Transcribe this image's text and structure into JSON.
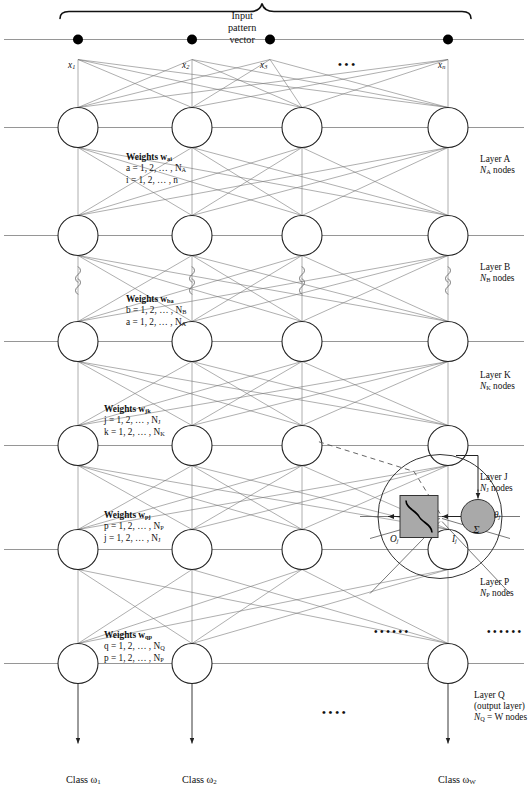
{
  "figure": {
    "type": "neural-network-diagram",
    "orientation": "rotated-90-ccw",
    "background": "#ffffff",
    "line_color": "#4a4a4a",
    "node_stroke": "#222222",
    "inset_fill": "#a9a9a9"
  },
  "outputs": {
    "class_labels": [
      "Class ω",
      "Class ω",
      "Class ω"
    ],
    "class_subs": [
      "1",
      "2",
      "W"
    ],
    "ellipsis": "• • • •"
  },
  "inputs": {
    "labels": [
      "x",
      "x",
      "x",
      "x"
    ],
    "subs": [
      "1",
      "2",
      "3",
      "n"
    ],
    "ellipsis": "• • •",
    "brace_label_lines": [
      "Input",
      "pattern",
      "vector"
    ]
  },
  "layers": [
    {
      "id": "layer-q",
      "lines": [
        "Layer Q",
        "(output layer)",
        "N  = W nodes"
      ],
      "name": "Layer Q",
      "sub": "Q",
      "detail": "(output layer)",
      "nodes_text": "N",
      "nodes_eq": "= W nodes",
      "node_count_visible": 3
    },
    {
      "id": "layer-p",
      "lines": [
        "Layer P",
        "N  nodes"
      ],
      "name": "Layer P",
      "sub": "P",
      "nodes_text": "N",
      "nodes_eq": "nodes",
      "node_count_visible": 4
    },
    {
      "id": "layer-j",
      "lines": [
        "Layer J",
        "N  nodes"
      ],
      "name": "Layer J",
      "sub": "J",
      "nodes_text": "N",
      "nodes_eq": "nodes",
      "node_count_visible": 4
    },
    {
      "id": "layer-k",
      "lines": [
        "Layer K",
        "N  nodes"
      ],
      "name": "Layer K",
      "sub": "K",
      "nodes_text": "N",
      "nodes_eq": "nodes",
      "node_count_visible": 4
    },
    {
      "id": "layer-b",
      "lines": [
        "Layer B",
        "N  nodes"
      ],
      "name": "Layer B",
      "sub": "B",
      "nodes_text": "N",
      "nodes_eq": "nodes",
      "node_count_visible": 4
    },
    {
      "id": "layer-a",
      "lines": [
        "Layer A",
        "N  nodes"
      ],
      "name": "Layer A",
      "sub": "A",
      "nodes_text": "N",
      "nodes_eq": "nodes",
      "node_count_visible": 4
    }
  ],
  "weights": [
    {
      "id": "weights-qp",
      "title": "Weights w",
      "title_sub": "qp",
      "range1": "q = 1, 2, … , N",
      "range1_sub": "Q",
      "range2": "p = 1, 2, … , N",
      "range2_sub": "P"
    },
    {
      "id": "weights-pj",
      "title": "Weights w",
      "title_sub": "pj",
      "range1": "p = 1, 2, … , N",
      "range1_sub": "P",
      "range2": "j = 1, 2, … , N",
      "range2_sub": "J"
    },
    {
      "id": "weights-jk",
      "title": "Weights w",
      "title_sub": "jk",
      "range1": "j = 1, 2, … , N",
      "range1_sub": "J",
      "range2": "k = 1, 2, … , N",
      "range2_sub": "K"
    },
    {
      "id": "weights-ba",
      "title": "Weights w",
      "title_sub": "ba",
      "range1": "b = 1, 2, … , N",
      "range1_sub": "B",
      "range2": "a = 1, 2, … , N",
      "range2_sub": "A"
    },
    {
      "id": "weights-ai",
      "title": "Weights w",
      "title_sub": "ai",
      "range1": "a = 1, 2, … , N",
      "range1_sub": "A",
      "range2": "i = 1, 2, … , n",
      "range2_sub": ""
    }
  ],
  "inset": {
    "id": "neuron-detail",
    "sigma": "Σ",
    "net_input": "I",
    "net_input_sub": "j",
    "output": "O",
    "output_sub": "j",
    "bias_theta": "θ",
    "bias_theta_sub": "j",
    "bias_one": "+1",
    "ellipsis_in": "• • •   • • •",
    "ellipsis_out": "• • •   • • •",
    "activation": "sigmoid"
  }
}
